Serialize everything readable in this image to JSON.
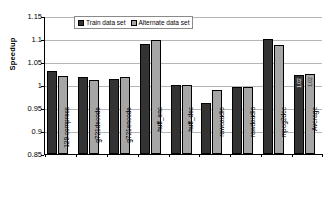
{
  "chart_data": {
    "type": "bar",
    "title": "",
    "xlabel": "",
    "ylabel": "Speedup",
    "ylim": [
      0.85,
      1.15
    ],
    "yticks": [
      "0.85",
      "0.9",
      "0.95",
      "1",
      "1.05",
      "1.1",
      "1.15"
    ],
    "grid": true,
    "legend_position": "top-center",
    "categories": [
      "129.compress",
      "g721decode",
      "g721encode",
      "huff_enc",
      "huff_dec",
      "rawcaudio",
      "rawdaudio",
      "mpeg2dec",
      "Average"
    ],
    "series": [
      {
        "name": "Train data set",
        "color": "#333333",
        "values": [
          1.03,
          1.017,
          1.013,
          1.089,
          0.999,
          0.961,
          0.996,
          1.101,
          1.022
        ]
      },
      {
        "name": "Alternate data set",
        "color": "#a6a6a6",
        "values": [
          1.019,
          1.011,
          1.018,
          1.097,
          0.999,
          0.99,
          0.996,
          1.088,
          1.024
        ]
      }
    ],
    "data_labels": {
      "Average": {
        "Train data set": "1.02",
        "Alternate data set": "1.02"
      }
    }
  },
  "legend": {
    "entries": [
      {
        "label": "Train data set"
      },
      {
        "label": "Alternate data set"
      }
    ]
  }
}
